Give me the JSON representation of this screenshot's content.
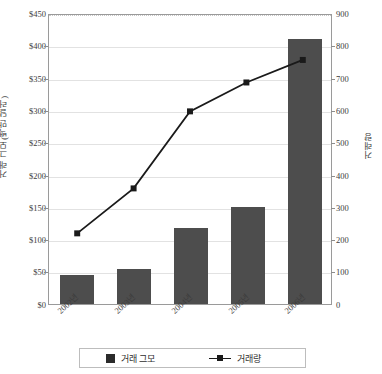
{
  "chart_data": {
    "type": "bar",
    "title": "",
    "subtitle": "",
    "categories": [
      "2002년",
      "2003년",
      "2004년",
      "2005년",
      "2006년"
    ],
    "series": [
      {
        "name": "거래 그모",
        "type": "bar",
        "axis": "left",
        "values": [
          45,
          55,
          118,
          150,
          412
        ],
        "color": "#4d4d4d"
      },
      {
        "name": "거래량",
        "type": "line",
        "axis": "right",
        "values": [
          220,
          360,
          600,
          690,
          760
        ],
        "color": "#1a1a1a"
      }
    ],
    "xlabel": "",
    "ylabel": "거래 그모(백만 달러)",
    "ylabel_right": "거래량",
    "ylim": [
      0,
      450
    ],
    "ylim_right": [
      0,
      900
    ],
    "ytick_labels": [
      "$0",
      "$50",
      "$100",
      "$150",
      "$200",
      "$250",
      "$300",
      "$350",
      "$400",
      "$450"
    ],
    "ytick_values": [
      0,
      50,
      100,
      150,
      200,
      250,
      300,
      350,
      400,
      450
    ],
    "ytick_labels_right": [
      "0",
      "100",
      "200",
      "300",
      "400",
      "500",
      "600",
      "700",
      "800",
      "900"
    ],
    "ytick_values_right": [
      0,
      100,
      200,
      300,
      400,
      500,
      600,
      700,
      800,
      900
    ],
    "grid": true,
    "legend_position": "bottom",
    "legend_entries": [
      "거래 그모",
      "거래량"
    ]
  },
  "axis_left": {
    "t0": "$0",
    "t1": "$50",
    "t2": "$100",
    "t3": "$150",
    "t4": "$200",
    "t5": "$250",
    "t6": "$300",
    "t7": "$350",
    "t8": "$400",
    "t9": "$450",
    "title": "거래 그모(백만 달러)"
  },
  "axis_right": {
    "t0": "0",
    "t1": "100",
    "t2": "200",
    "t3": "300",
    "t4": "400",
    "t5": "500",
    "t6": "600",
    "t7": "700",
    "t8": "800",
    "t9": "900",
    "title": "거래량"
  },
  "axis_x": {
    "c0": "2002년",
    "c1": "2003년",
    "c2": "2004년",
    "c3": "2005년",
    "c4": "2006년"
  },
  "legend": {
    "bars_label": "거래 그모",
    "line_label": "거래량"
  }
}
